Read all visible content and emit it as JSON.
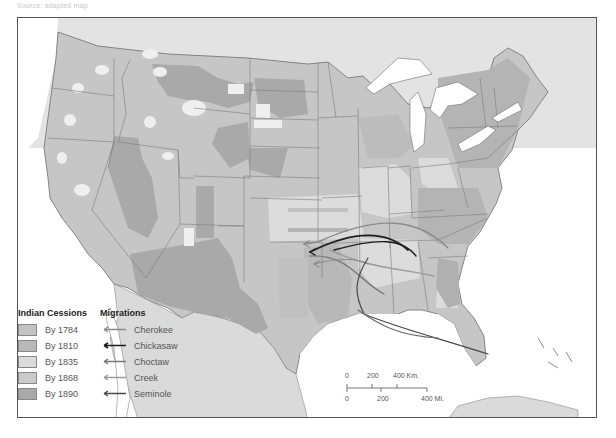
{
  "caption": "Source: adapted map",
  "map": {
    "title": "Indian Cessions and Migrations",
    "colors": {
      "land_base": "#c9c9c9",
      "canada": "#e3e3e3",
      "mexico": "#dadada",
      "water": "#ffffff",
      "borders": "#7a7a7a",
      "by_1784": "#c3c3c3",
      "by_1810": "#b8b8b8",
      "by_1835": "#dcdcdc",
      "by_1868": "#c9c9c9",
      "by_1890": "#a9a9a9",
      "unceded": "#efefef"
    }
  },
  "legend": {
    "cessions_title": "Indian Cessions",
    "migrations_title": "Migrations",
    "cessions": [
      {
        "label": "By 1784",
        "color": "#c3c3c3"
      },
      {
        "label": "By 1810",
        "color": "#b8b8b8"
      },
      {
        "label": "By 1835",
        "color": "#dcdcdc"
      },
      {
        "label": "By 1868",
        "color": "#cbcbcb"
      },
      {
        "label": "By 1890",
        "color": "#a9a9a9"
      }
    ],
    "migrations": [
      {
        "label": "Cherokee",
        "color": "#8a8a8a",
        "icon": "arrow-left-icon"
      },
      {
        "label": "Chickasaw",
        "color": "#1e1e1e",
        "icon": "arrow-left-icon"
      },
      {
        "label": "Choctaw",
        "color": "#7a7a7a",
        "icon": "arrow-left-icon"
      },
      {
        "label": "Creek",
        "color": "#9a9a9a",
        "icon": "arrow-left-icon"
      },
      {
        "label": "Seminole",
        "color": "#4a4a4a",
        "icon": "arrow-left-icon"
      }
    ]
  },
  "scale": {
    "km_labels": [
      "0",
      "200",
      "400 Km."
    ],
    "mi_labels": [
      "0",
      "200",
      "400 Mi."
    ]
  }
}
